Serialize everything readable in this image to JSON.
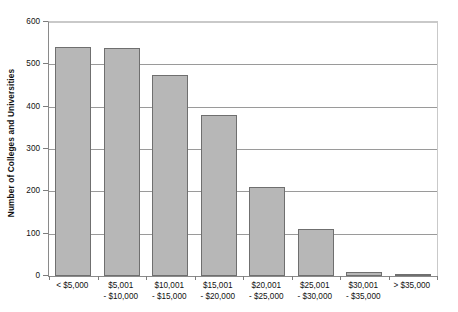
{
  "chart_data": {
    "type": "bar",
    "title": "",
    "xlabel": "",
    "ylabel": "Number of Colleges and Universities",
    "ylim": [
      0,
      600
    ],
    "yticks": [
      0,
      100,
      200,
      300,
      400,
      500,
      600
    ],
    "grid": true,
    "legend": "none",
    "categories": [
      "< $5,000",
      "$5,001 - $10,000",
      "$10,001 - $15,000",
      "$15,001 - $20,000",
      "$20,001 - $25,000",
      "$25,001 - $30,000",
      "$30,001 - $35,000",
      "> $35,000"
    ],
    "category_lines": [
      {
        "line1": "< $5,000",
        "line2": ""
      },
      {
        "line1": "$5,001",
        "line2": "- $10,000"
      },
      {
        "line1": "$10,001",
        "line2": "- $15,000"
      },
      {
        "line1": "$15,001",
        "line2": "- $20,000"
      },
      {
        "line1": "$20,001",
        "line2": "- $25,000"
      },
      {
        "line1": "$25,001",
        "line2": "- $30,000"
      },
      {
        "line1": "$30,001",
        "line2": "- $35,000"
      },
      {
        "line1": "> $35,000",
        "line2": ""
      }
    ],
    "values": [
      540,
      538,
      475,
      380,
      210,
      110,
      10,
      2
    ]
  },
  "style": {
    "bar_fill": "#b7b7b7",
    "bar_border": "#6f6f6f",
    "grid_color": "#9a9a9a",
    "axis_color": "#8a8a8a",
    "text_color": "#111111",
    "background": "#ffffff"
  }
}
